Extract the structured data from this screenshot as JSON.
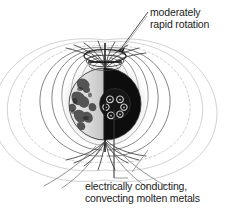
{
  "figure": {
    "width": 237,
    "height": 213,
    "background_color": "#ffffff"
  },
  "annotations": [
    {
      "id": "rotation",
      "line1": "moderately",
      "line2": "rapid rotation",
      "leader": "diagonal-line-to-pole-ring",
      "x": 150,
      "y": 7
    },
    {
      "id": "core",
      "line1": "electrically conducting,",
      "line2": "convecting molten metals",
      "leader": "vertical-line-to-core",
      "x": 85,
      "y": 181
    }
  ],
  "diagram": {
    "planet": {
      "name": "planet-sphere",
      "center_x": 105,
      "center_y": 104,
      "radius": 36,
      "light_hemisphere_color": "#e8e8e8",
      "dark_hemisphere_color": "#0d0d0d",
      "halo_color": "#d8d8d8",
      "terminator_x": 105
    },
    "core": {
      "name": "molten-metal-core",
      "center_x": 115,
      "center_y": 104,
      "radius": 15,
      "color": "#161616",
      "convection_cells": 6
    },
    "rotation_ring": {
      "name": "rotation-arrow-ring",
      "center_x": 105,
      "center_y": 55,
      "rx": 21,
      "ry": 7,
      "color": "#2a2a2a"
    },
    "rotation_axis": {
      "name": "rotation-axis-line",
      "x": 105,
      "top_y": 44,
      "bottom_y": 152,
      "color": "#161616"
    },
    "field_lines": {
      "name": "magnetic-field-lines",
      "count": 22,
      "stroke_color": "#5a5a5a",
      "faint_stroke_color": "#bdbdbd",
      "description": "dipole magnetic field loops emanating from poles"
    }
  },
  "colors": {
    "text": "#1c1c1c",
    "field_line": "#5a5a5a",
    "field_line_faint": "#b8b8b8",
    "dark": "#0d0d0d",
    "light": "#e8e8e8",
    "background": "#ffffff"
  }
}
